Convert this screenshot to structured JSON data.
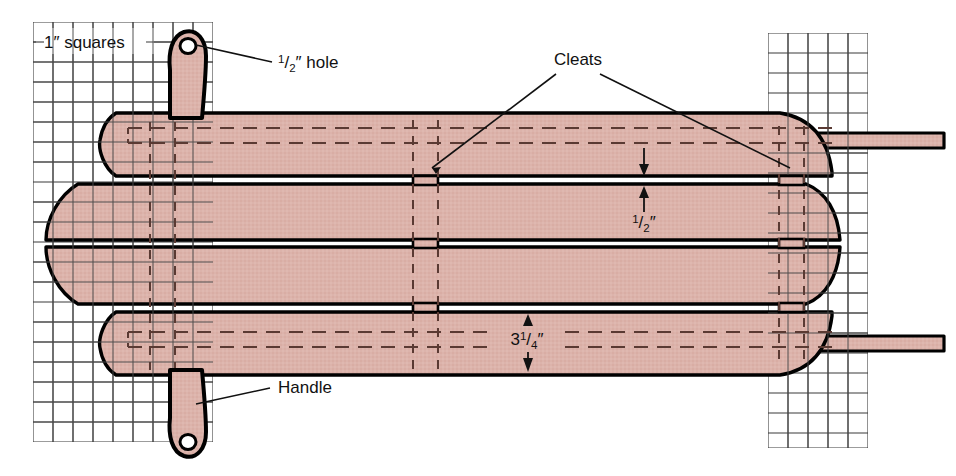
{
  "diagram": {
    "labels": {
      "grid_note": "1″ squares",
      "hole": "½″ hole",
      "hole_num": "1",
      "hole_den": "2",
      "hole_suffix": "″ hole",
      "cleats": "Cleats",
      "handle": "Handle",
      "gap_dim_num": "1",
      "gap_dim_den": "2",
      "gap_dim_suffix": "″",
      "slat_width_whole": "3",
      "slat_width_num": "1",
      "slat_width_den": "4",
      "slat_width_suffix": "″"
    },
    "colors": {
      "wood_fill": "#dcb3ab",
      "wood_fill_alt": "#d9aca4",
      "outline": "#000000",
      "grid_line": "#3a3a3a",
      "hidden_line": "#5a3a33",
      "text": "#111111",
      "background": "#ffffff"
    },
    "grid": {
      "label": "1″ squares",
      "cell_px": 20,
      "left_panel": {
        "x": 33,
        "y": 22,
        "w": 180,
        "h": 420
      },
      "right_panel": {
        "x": 768,
        "y": 33,
        "w": 100,
        "h": 415
      }
    },
    "dimensions": [
      {
        "name": "slat-gap",
        "value": "½″",
        "描述": "gap between slats"
      },
      {
        "name": "slat-width",
        "value": "3¼″",
        "描述": "width of each slat"
      },
      {
        "name": "handle-hole",
        "value": "½″",
        "描述": "diameter of handle hole"
      }
    ],
    "parts": [
      {
        "name": "slat",
        "count": 4
      },
      {
        "name": "cleat",
        "count": 2
      },
      {
        "name": "handle",
        "count": 2
      },
      {
        "name": "rail",
        "count": 2
      }
    ]
  }
}
